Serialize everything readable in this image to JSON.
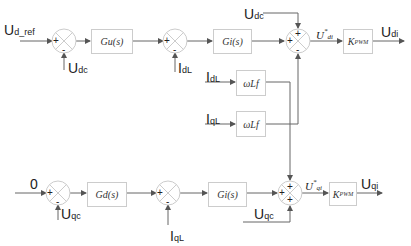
{
  "diagram": {
    "title": "",
    "colors": {
      "line": "#666666",
      "block_border": "#cccccc",
      "text": "#222222"
    },
    "d_axis": {
      "input": {
        "main": "U",
        "sub": "d_ref"
      },
      "summer1": {
        "plus": "+",
        "minus": "-",
        "feedback": {
          "main": "U",
          "sub": "dc"
        }
      },
      "block1": "Gu(s)",
      "summer2": {
        "plus": "+",
        "minus": "-",
        "feedback": {
          "main": "I",
          "sub": "dL"
        }
      },
      "block2": "Gi(s)",
      "summer3": {
        "plus_top": "+",
        "plus_left": "+",
        "minus_bottom": "-",
        "top_input": {
          "main": "U",
          "sub": "dc"
        }
      },
      "ref_label": {
        "main": "U",
        "sup": "*",
        "sub": "di"
      },
      "pwm_block": {
        "main": "K",
        "sub": "PWM"
      },
      "output": {
        "main": "U",
        "sub": "di"
      }
    },
    "coupling": {
      "block_d": {
        "label": "ωLf",
        "input": {
          "main": "I",
          "sub": "dL"
        }
      },
      "block_q": {
        "label": "ωLf",
        "input": {
          "main": "I",
          "sub": "qL"
        }
      }
    },
    "q_axis": {
      "input": "0",
      "summer1": {
        "plus": "+",
        "minus": "-",
        "feedback": {
          "main": "U",
          "sub": "qc"
        }
      },
      "block1": "Gd(s)",
      "summer2": {
        "plus": "+",
        "minus": "-",
        "feedback": {
          "main": "I",
          "sub": "qL"
        }
      },
      "block2": "Gi(s)",
      "summer3": {
        "plus_top": "+",
        "plus_left": "+",
        "plus_bottom": "+",
        "bottom_input": {
          "main": "U",
          "sub": "qc"
        }
      },
      "ref_label": {
        "main": "U",
        "sup": "*",
        "sub": "qi"
      },
      "pwm_block": {
        "main": "K",
        "sub": "PWM"
      },
      "output": {
        "main": "U",
        "sub": "qi"
      }
    }
  }
}
